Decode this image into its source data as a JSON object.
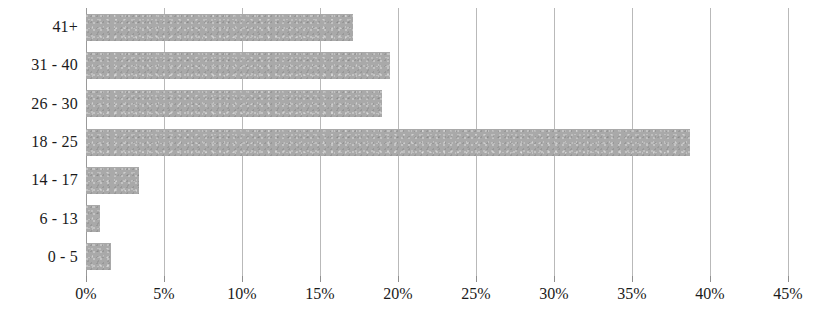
{
  "chart_data": {
    "type": "bar",
    "orientation": "horizontal",
    "title": "",
    "xlabel": "",
    "ylabel": "",
    "categories": [
      "0 - 5",
      "6 - 13",
      "14 - 17",
      "18 - 25",
      "26 - 30",
      "31 - 40",
      "41+"
    ],
    "values": [
      1.6,
      0.9,
      3.4,
      38.7,
      19.0,
      19.5,
      17.1
    ],
    "value_suffix": "%",
    "xlim": [
      0,
      45
    ],
    "xticks": [
      0,
      5,
      10,
      15,
      20,
      25,
      30,
      35,
      40,
      45
    ],
    "xtick_labels": [
      "0%",
      "5%",
      "10%",
      "15%",
      "20%",
      "25%",
      "30%",
      "35%",
      "40%",
      "45%"
    ],
    "grid": "vertical",
    "legend": "none",
    "bar_color": "#a9a9a9",
    "gridline_color": "#b9b9b9",
    "text_color": "#1a1a1a",
    "series": [
      {
        "name": "Share",
        "values": [
          1.6,
          0.9,
          3.4,
          38.7,
          19.0,
          19.5,
          17.1
        ]
      }
    ],
    "points": [
      {
        "category": "41+",
        "value": 17.1
      },
      {
        "category": "31 - 40",
        "value": 19.5
      },
      {
        "category": "26 - 30",
        "value": 19.0
      },
      {
        "category": "18 - 25",
        "value": 38.7
      },
      {
        "category": "14 - 17",
        "value": 3.4
      },
      {
        "category": "6 - 13",
        "value": 0.9
      },
      {
        "category": "0 - 5",
        "value": 1.6
      }
    ]
  }
}
